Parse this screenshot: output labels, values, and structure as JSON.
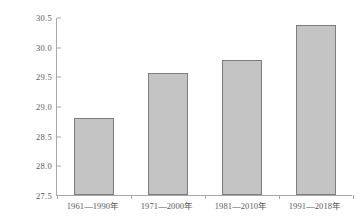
{
  "chart_data": {
    "type": "bar",
    "title": "",
    "xlabel": "",
    "ylabel": "雨强/ (mm/h)",
    "categories": [
      "1961—1990年",
      "1971—2000年",
      "1981—2010年",
      "1991—2018年"
    ],
    "values": [
      28.8,
      29.55,
      29.78,
      30.37
    ],
    "ylim": [
      27.5,
      30.5
    ],
    "ytick_labels": [
      "27.5",
      "28.0",
      "28.5",
      "29.0",
      "29.5",
      "30.0",
      "30.5"
    ],
    "ytick_values": [
      27.5,
      28.0,
      28.5,
      29.0,
      29.5,
      30.0,
      30.5
    ],
    "grid": false,
    "legend": false,
    "series": [
      {
        "name": "雨强",
        "values": [
          28.8,
          29.55,
          29.78,
          30.37
        ]
      }
    ],
    "colors": {
      "bar_fill": "#c4c4c4",
      "bar_border": "#7d7d7d",
      "axis": "#a8a8a8",
      "text": "#5a5a5a",
      "background": "#ffffff"
    }
  }
}
